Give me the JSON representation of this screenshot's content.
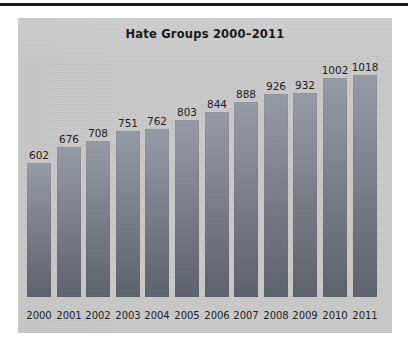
{
  "page": {
    "background_color": "#ffffff",
    "rule_color": "#1a1a1a"
  },
  "panel": {
    "background_color": "#c9c9c9",
    "bar_color_top": "#969ba6",
    "bar_color_bottom": "#5e626a",
    "text_color": "#1c1c1c"
  },
  "chart_data": {
    "type": "bar",
    "title": "Hate Groups 2000–2011",
    "subtitle": "",
    "xlabel": "",
    "ylabel": "",
    "categories": [
      "2000",
      "2001",
      "2002",
      "2003",
      "2004",
      "2005",
      "2006",
      "2007",
      "2008",
      "2009",
      "2010",
      "2011"
    ],
    "values": [
      602,
      676,
      708,
      751,
      762,
      803,
      844,
      888,
      926,
      932,
      1002,
      1018
    ],
    "data_labels": [
      "602",
      "676",
      "708",
      "751",
      "762",
      "803",
      "844",
      "888",
      "926",
      "932",
      "1002",
      "1018"
    ],
    "ylim": [
      0,
      1080
    ],
    "grid": false,
    "legend": false,
    "legend_position": "none",
    "axis_visible": false,
    "annotations": []
  }
}
